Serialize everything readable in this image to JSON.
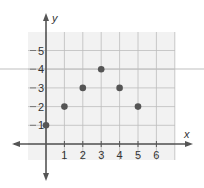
{
  "chart_data": {
    "type": "scatter",
    "title": "",
    "xlabel": "x",
    "ylabel": "y",
    "xlim": [
      -1.7,
      6.6
    ],
    "ylim": [
      -1.7,
      6.0
    ],
    "grid": true,
    "legend": null,
    "x_ticks": [
      "1",
      "2",
      "3",
      "4",
      "5",
      "6"
    ],
    "y_ticks": [
      "1",
      "2",
      "3",
      "4",
      "5"
    ],
    "points": [
      {
        "x": 0,
        "y": 1
      },
      {
        "x": 1,
        "y": 2
      },
      {
        "x": 2,
        "y": 3
      },
      {
        "x": 3,
        "y": 4
      },
      {
        "x": 4,
        "y": 3
      },
      {
        "x": 5,
        "y": 2
      }
    ],
    "colors": {
      "point": "#555555",
      "axis": "#555555",
      "grid": "#bdbdbd",
      "grid_bg": "#f1f1f1"
    }
  }
}
